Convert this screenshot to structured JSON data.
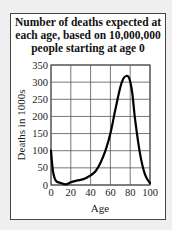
{
  "chart_data": {
    "type": "line",
    "title": "Number of deaths expected at each age, based on 10,000,000 people starting at age 0",
    "title_lines": [
      "Number of deaths expected at",
      "each age, based on 10,000,000",
      "people starting at age 0"
    ],
    "xlabel": "Age",
    "ylabel": "Deaths in 1000s",
    "xlim": [
      0,
      100
    ],
    "ylim": [
      0,
      350
    ],
    "xticks": [
      0,
      20,
      40,
      60,
      80,
      100
    ],
    "yticks": [
      0,
      50,
      100,
      150,
      200,
      250,
      300,
      350
    ],
    "grid": true,
    "series": [
      {
        "name": "Deaths",
        "x": [
          0,
          2,
          5,
          10,
          15,
          20,
          25,
          30,
          35,
          40,
          45,
          50,
          55,
          60,
          65,
          70,
          73,
          76,
          79,
          82,
          85,
          90,
          95,
          100
        ],
        "y": [
          100,
          40,
          12,
          6,
          2,
          8,
          12,
          15,
          20,
          28,
          40,
          65,
          100,
          150,
          220,
          285,
          310,
          318,
          312,
          270,
          190,
          90,
          30,
          5
        ]
      }
    ]
  }
}
